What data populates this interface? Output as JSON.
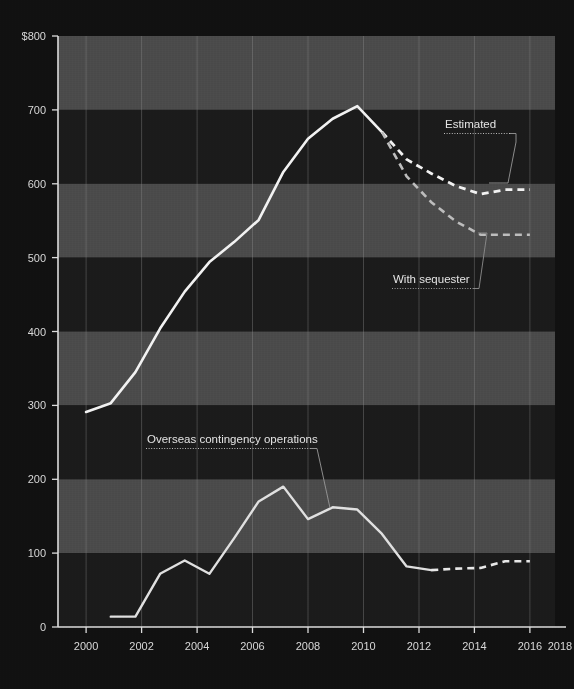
{
  "chart_data": {
    "type": "line",
    "title": "",
    "subtitle": "",
    "xlabel": "",
    "ylabel": "",
    "currency_prefix": "$",
    "xlim": [
      2000,
      2018
    ],
    "ylim": [
      0,
      800
    ],
    "ytick_values": [
      0,
      100,
      200,
      300,
      400,
      500,
      600,
      700,
      800
    ],
    "ytick_labels": [
      "0",
      "100",
      "200",
      "300",
      "400",
      "500",
      "600",
      "700",
      "$800"
    ],
    "xtick_values": [
      2000,
      2002,
      2004,
      2006,
      2008,
      2010,
      2012,
      2014,
      2016,
      2018
    ],
    "xtick_labels": [
      "2000",
      "2002",
      "2004",
      "2006",
      "2008",
      "2010",
      "2012",
      "2014",
      "2016",
      "2018"
    ],
    "grid": "banded-horizontal-100-plus-vertical-year-lines",
    "legend": "none-inline-annotations",
    "series": [
      {
        "name": "Total defense budget (actual)",
        "style": "solid",
        "color": "#f2f2f2",
        "x": [
          2000,
          2001,
          2002,
          2003,
          2004,
          2005,
          2006,
          2007,
          2008,
          2009,
          2010,
          2011,
          2012
        ],
        "values": [
          291,
          303,
          345,
          404,
          454,
          494,
          521,
          551,
          616,
          661,
          688,
          705,
          670
        ]
      },
      {
        "name": "Estimated",
        "style": "dashed",
        "color": "#f2f2f2",
        "x": [
          2012,
          2013,
          2014,
          2015,
          2016,
          2017,
          2018
        ],
        "values": [
          670,
          633,
          614,
          597,
          586,
          592,
          592
        ]
      },
      {
        "name": "With sequester",
        "style": "dashed",
        "color": "#bdbdbd",
        "x": [
          2012,
          2013,
          2014,
          2015,
          2016,
          2017,
          2018
        ],
        "values": [
          670,
          610,
          575,
          549,
          531,
          531,
          531
        ]
      },
      {
        "name": "Overseas contingency operations",
        "style": "solid",
        "color": "#e0e0e0",
        "x": [
          2001,
          2002,
          2003,
          2004,
          2005,
          2006,
          2007,
          2008,
          2009,
          2010,
          2011,
          2012,
          2013,
          2014
        ],
        "values": [
          14,
          14,
          72,
          90,
          72,
          120,
          170,
          190,
          146,
          162,
          159,
          126,
          82,
          77
        ]
      },
      {
        "name": "Overseas contingency operations (estimated)",
        "style": "dashed",
        "color": "#e8e8e8",
        "x": [
          2014,
          2015,
          2016,
          2017,
          2018
        ],
        "values": [
          77,
          79,
          80,
          89,
          89
        ]
      }
    ],
    "annotations": [
      {
        "id": "estimated",
        "label": "Estimated",
        "underline": "dotted",
        "leader": "line-from-label-right-down-to-series"
      },
      {
        "id": "with-sequester",
        "label": "With sequester",
        "underline": "dotted",
        "leader": "line-from-label-right-up-to-series"
      },
      {
        "id": "oco",
        "label": "Overseas contingency operations",
        "underline": "dotted",
        "leader": "line-from-label-right-down-to-series"
      }
    ]
  },
  "axis": {
    "y": {
      "labels": [
        "$800",
        "700",
        "600",
        "500",
        "400",
        "300",
        "200",
        "100",
        "0"
      ]
    },
    "x": {
      "labels": [
        "2000",
        "2002",
        "2004",
        "2006",
        "2008",
        "2010",
        "2012",
        "2014",
        "2016",
        "2018"
      ]
    }
  },
  "annotations": {
    "estimated": "Estimated",
    "with_sequester": "With sequester",
    "oco": "Overseas contingency operations"
  },
  "colors": {
    "background": "#111111",
    "band_light": "#4a4a4a",
    "band_dark": "#1a1a1a",
    "line_primary": "#f2f2f2",
    "line_secondary": "#bdbdbd",
    "axis": "#dcdcdc",
    "text": "#e4e4e4"
  }
}
